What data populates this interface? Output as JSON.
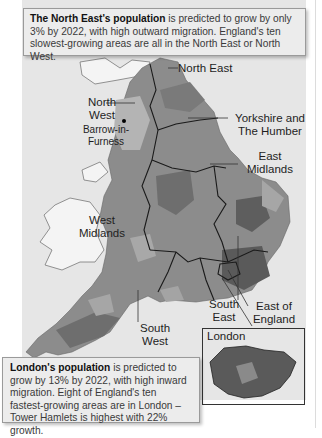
{
  "top_caption": {
    "bold": "The North East's population",
    "text": " is predicted to grow by only 3% by 2022, with high outward migration. England's ten slowest-growing areas are all in the North East or North West."
  },
  "bottom_caption": {
    "bold": "London's population",
    "text": " is predicted to grow by 13% by 2022, with high inward migration. Eight of England's ten fastest-growing areas are in London – Tower Hamlets is highest with 22% growth."
  },
  "regions": {
    "north_east": "North East",
    "north_west": "North West",
    "yorkshire": "Yorkshire and The Humber",
    "east_midlands": "East Midlands",
    "west_midlands": "West Midlands",
    "south_west": "South West",
    "south_east": "South East",
    "east_of_england": "East of England",
    "london": "London"
  },
  "places": {
    "barrow": "Barrow-in-Furness"
  },
  "colors": {
    "panel_bg": "#e6e6e6",
    "land_dark": "#6e6e6e",
    "land_mid": "#8c8c8c",
    "land_light": "#a8a8a8",
    "wales_land": "#f4f4f4",
    "boundary": "#1a1a1a"
  }
}
